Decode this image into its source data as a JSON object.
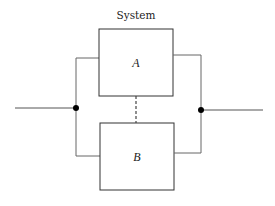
{
  "diagram": {
    "title": "System",
    "components": [
      {
        "id": "A",
        "label": "A"
      },
      {
        "id": "B",
        "label": "B"
      }
    ],
    "topology": "parallel",
    "link_between_components": "dashed",
    "colors": {
      "stroke": "#555555",
      "box_stroke": "#333333",
      "node": "#000000",
      "text": "#222222"
    }
  }
}
